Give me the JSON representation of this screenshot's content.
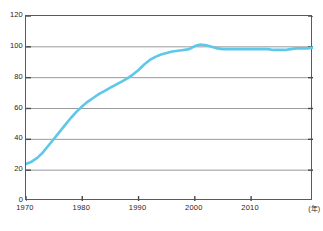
{
  "figure": {
    "title_partial": "",
    "footnote": "",
    "background_color": "#ffffff"
  },
  "axes": {
    "frame_color": "#5a5a5a",
    "gridline_color": "#9a9a9a",
    "tick_color": "#4a4a4a",
    "x_unit_label": "(年)",
    "y_unit_label": ""
  },
  "chart_data": {
    "type": "line",
    "title": "",
    "xlabel": "(年)",
    "ylabel": "",
    "xlim": [
      1970,
      2021
    ],
    "ylim": [
      0,
      120
    ],
    "xticks": [
      1970,
      1980,
      1990,
      2000,
      2010
    ],
    "xtick_labels": [
      "1970",
      "1980",
      "1990",
      "2000",
      "2010"
    ],
    "yticks": [
      0,
      20,
      40,
      60,
      80,
      100,
      120
    ],
    "ytick_labels": [
      "0",
      "20",
      "40",
      "60",
      "80",
      "100",
      "120"
    ],
    "grid": true,
    "grid_axis": "y",
    "legend": null,
    "series": [
      {
        "name": "普及率",
        "color": "#5ec8e8",
        "line_width": 2.6,
        "x": [
          1970,
          1971,
          1972,
          1973,
          1974,
          1975,
          1976,
          1977,
          1978,
          1979,
          1980,
          1981,
          1982,
          1983,
          1984,
          1985,
          1986,
          1987,
          1988,
          1989,
          1990,
          1991,
          1992,
          1993,
          1994,
          1995,
          1996,
          1997,
          1998,
          1999,
          2000,
          2001,
          2002,
          2003,
          2004,
          2005,
          2006,
          2007,
          2008,
          2009,
          2010,
          2011,
          2012,
          2013,
          2014,
          2015,
          2016,
          2017,
          2018,
          2019,
          2020,
          2021
        ],
        "y": [
          24.0,
          25.5,
          28.0,
          31.5,
          36.0,
          40.5,
          45.0,
          49.5,
          54.0,
          58.0,
          61.5,
          64.5,
          67.0,
          69.5,
          71.5,
          73.5,
          75.5,
          77.5,
          79.5,
          82.0,
          85.0,
          88.5,
          91.5,
          93.5,
          95.0,
          96.0,
          97.0,
          97.5,
          98.0,
          98.5,
          100.5,
          101.5,
          101.0,
          100.0,
          99.0,
          98.5,
          98.5,
          98.5,
          98.5,
          98.5,
          98.5,
          98.5,
          98.5,
          98.5,
          98.0,
          98.0,
          98.0,
          98.5,
          99.0,
          99.0,
          99.0,
          99.5
        ]
      }
    ]
  }
}
